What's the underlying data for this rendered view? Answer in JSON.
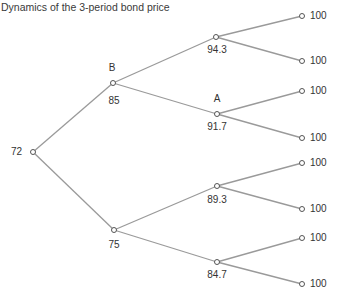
{
  "title": "Dynamics of the 3-period bond price",
  "colors": {
    "edge": "#9a9a9a",
    "node_stroke": "#555555",
    "text": "#333333"
  },
  "nodes": {
    "root": {
      "value": "72"
    },
    "B": {
      "tag": "B",
      "value": "85"
    },
    "down1": {
      "value": "75"
    },
    "uu": {
      "value": "94.3"
    },
    "A": {
      "tag": "A",
      "value": "91.7"
    },
    "du": {
      "value": "89.3"
    },
    "dd": {
      "value": "84.7"
    },
    "terminals": [
      "100",
      "100",
      "100",
      "100",
      "100",
      "100",
      "100",
      "100"
    ]
  }
}
